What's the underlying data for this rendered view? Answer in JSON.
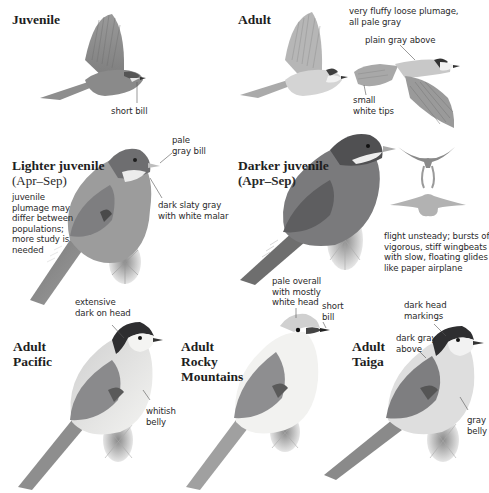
{
  "page": {
    "sections": [
      {
        "id": "juvenile-flight",
        "title": "Juvenile",
        "labels": [
          "short bill"
        ]
      },
      {
        "id": "adult-flight",
        "title": "Adult",
        "labels": [
          "very fluffy loose plumage,\nall pale gray",
          "plain gray above",
          "small\nwhite tips"
        ]
      },
      {
        "id": "lighter-juvenile",
        "title": "Lighter juvenile",
        "subtitle": "(Apr–Sep)",
        "note": "juvenile\nplumage may\ndiffer between\npopulations;\nmore study is\nneeded",
        "labels": [
          "pale\ngray bill",
          "dark slaty gray\nwith white malar"
        ]
      },
      {
        "id": "darker-juvenile",
        "title": "Darker juvenile",
        "subtitle": "(Apr–Sep)",
        "labels": [
          "flight unsteady; bursts of\nvigorous, stiff wingbeats\nwith slow, floating glides\nlike paper airplane"
        ]
      },
      {
        "id": "adult-pacific",
        "title": "Adult\nPacific",
        "labels": [
          "extensive\ndark on head",
          "whitish\nbelly"
        ]
      },
      {
        "id": "adult-rocky",
        "title": "Adult\nRocky\nMountains",
        "labels": [
          "pale overall\nwith mostly\nwhite head",
          "short\nbill"
        ]
      },
      {
        "id": "adult-taiga",
        "title": "Adult\nTaiga",
        "labels": [
          "dark head\nmarkings",
          "dark gray\nabove",
          "gray\nbelly"
        ]
      }
    ]
  },
  "colors": {
    "background": "#ffffff",
    "text": "#222222",
    "leader_line": "#555555",
    "bird_gray_dark": "#4a4a4c",
    "bird_gray_mid": "#8a8a8c",
    "bird_gray_light": "#c4c4c4",
    "bird_white": "#f2f2f0"
  }
}
